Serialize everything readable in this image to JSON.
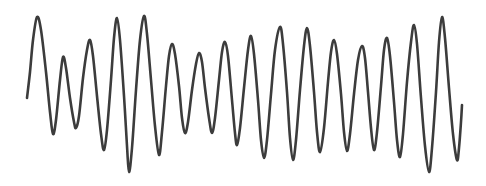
{
  "figure": {
    "title": "",
    "type": "waveform-oscillogram",
    "width": 486,
    "height": 186,
    "background_color": "#ffffff"
  },
  "trace": {
    "name": "oscillogram-trace",
    "stroke_color": "#3c3c3c",
    "stroke_width": 2.6,
    "smoothing": "catmull-rom"
  },
  "chart_data": {
    "type": "line",
    "title": "",
    "subtitle": "",
    "xlabel": "",
    "ylabel": "",
    "xlim": [
      0,
      486
    ],
    "ylim": [
      186,
      0
    ],
    "grid": false,
    "legend": null,
    "axes_visible": false,
    "tick_labels_x": [],
    "tick_labels_y": [],
    "series": [
      {
        "name": "waveform",
        "color": "#3c3c3c",
        "points": [
          [
            27,
            98
          ],
          [
            30,
            72
          ],
          [
            33,
            40
          ],
          [
            37,
            17
          ],
          [
            41,
            30
          ],
          [
            46,
            72
          ],
          [
            50,
            112
          ],
          [
            53,
            134
          ],
          [
            56,
            120
          ],
          [
            60,
            80
          ],
          [
            63,
            57
          ],
          [
            66,
            68
          ],
          [
            70,
            98
          ],
          [
            74,
            122
          ],
          [
            76,
            128
          ],
          [
            79,
            116
          ],
          [
            83,
            78
          ],
          [
            87,
            50
          ],
          [
            90,
            40
          ],
          [
            93,
            56
          ],
          [
            97,
            96
          ],
          [
            101,
            134
          ],
          [
            104,
            150
          ],
          [
            107,
            130
          ],
          [
            111,
            80
          ],
          [
            114,
            38
          ],
          [
            117,
            18
          ],
          [
            120,
            40
          ],
          [
            124,
            96
          ],
          [
            127,
            146
          ],
          [
            129,
            172
          ],
          [
            132,
            148
          ],
          [
            136,
            90
          ],
          [
            140,
            40
          ],
          [
            144,
            16
          ],
          [
            147,
            34
          ],
          [
            151,
            80
          ],
          [
            155,
            126
          ],
          [
            159,
            155
          ],
          [
            162,
            132
          ],
          [
            166,
            86
          ],
          [
            169,
            56
          ],
          [
            172,
            44
          ],
          [
            175,
            54
          ],
          [
            179,
            86
          ],
          [
            182,
            118
          ],
          [
            185,
            133
          ],
          [
            188,
            122
          ],
          [
            192,
            90
          ],
          [
            196,
            64
          ],
          [
            199,
            53
          ],
          [
            202,
            62
          ],
          [
            205,
            88
          ],
          [
            209,
            118
          ],
          [
            212,
            133
          ],
          [
            215,
            118
          ],
          [
            219,
            80
          ],
          [
            222,
            52
          ],
          [
            225,
            42
          ],
          [
            228,
            56
          ],
          [
            232,
            100
          ],
          [
            235,
            133
          ],
          [
            237,
            145
          ],
          [
            240,
            128
          ],
          [
            244,
            88
          ],
          [
            248,
            50
          ],
          [
            251,
            36
          ],
          [
            254,
            54
          ],
          [
            258,
            100
          ],
          [
            261,
            140
          ],
          [
            264,
            158
          ],
          [
            267,
            140
          ],
          [
            271,
            94
          ],
          [
            275,
            50
          ],
          [
            280,
            27
          ],
          [
            283,
            44
          ],
          [
            287,
            92
          ],
          [
            290,
            138
          ],
          [
            293,
            160
          ],
          [
            296,
            140
          ],
          [
            300,
            90
          ],
          [
            304,
            46
          ],
          [
            307,
            28
          ],
          [
            310,
            46
          ],
          [
            314,
            92
          ],
          [
            317,
            132
          ],
          [
            320,
            152
          ],
          [
            324,
            128
          ],
          [
            328,
            82
          ],
          [
            331,
            52
          ],
          [
            334,
            40
          ],
          [
            337,
            54
          ],
          [
            341,
            94
          ],
          [
            344,
            132
          ],
          [
            347,
            151
          ],
          [
            350,
            134
          ],
          [
            354,
            94
          ],
          [
            358,
            60
          ],
          [
            362,
            46
          ],
          [
            365,
            58
          ],
          [
            368,
            92
          ],
          [
            371,
            128
          ],
          [
            374,
            150
          ],
          [
            377,
            132
          ],
          [
            381,
            86
          ],
          [
            384,
            50
          ],
          [
            387,
            38
          ],
          [
            390,
            56
          ],
          [
            394,
            102
          ],
          [
            397,
            140
          ],
          [
            400,
            157
          ],
          [
            403,
            134
          ],
          [
            407,
            82
          ],
          [
            411,
            42
          ],
          [
            414,
            25
          ],
          [
            417,
            44
          ],
          [
            421,
            98
          ],
          [
            425,
            146
          ],
          [
            429,
            172
          ],
          [
            432,
            148
          ],
          [
            436,
            92
          ],
          [
            439,
            42
          ],
          [
            442,
            17
          ],
          [
            445,
            38
          ],
          [
            449,
            88
          ],
          [
            453,
            134
          ],
          [
            457,
            160
          ],
          [
            459,
            148
          ],
          [
            461,
            122
          ],
          [
            462,
            105
          ]
        ]
      }
    ]
  }
}
